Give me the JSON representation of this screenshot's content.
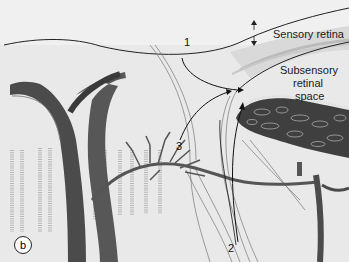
{
  "figure": {
    "panel_label": "b",
    "labels": {
      "sensory_retina": "Sensory retina",
      "subsensory_line1": "Subsensory",
      "subsensory_line2": "retinal",
      "subsensory_line3": "space"
    },
    "arrows": [
      {
        "number": "1"
      },
      {
        "number": "2"
      },
      {
        "number": "3"
      }
    ],
    "colors": {
      "background": "#e9e9e9",
      "upper_region": "#efefef",
      "retina_band": "#d8d8d8",
      "vessel": "#555555",
      "vessel_dark": "#3d3d3d",
      "line": "#222222"
    }
  }
}
